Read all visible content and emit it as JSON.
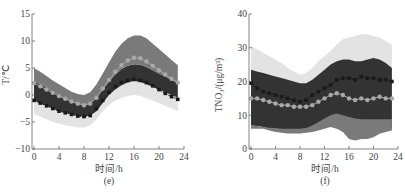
{
  "chart_data": [
    {
      "type": "area",
      "panel_label": "(e)",
      "xlabel": "时间/h",
      "ylabel": "T/℃",
      "xlim": [
        0,
        24
      ],
      "ylim": [
        -10,
        15
      ],
      "xticks": [
        0,
        4,
        8,
        12,
        16,
        20,
        24
      ],
      "yticks": [
        -10,
        -5,
        0,
        5,
        10,
        15
      ],
      "x": [
        0,
        1,
        2,
        3,
        4,
        5,
        6,
        7,
        8,
        9,
        10,
        11,
        12,
        13,
        14,
        15,
        16,
        17,
        18,
        19,
        20,
        21,
        22,
        23
      ],
      "bands": [
        {
          "name": "light-range",
          "color": "#e3e3e3",
          "upper": [
            -1,
            -1.5,
            -2,
            -2.5,
            -3,
            -3.5,
            -3.8,
            -4,
            -4.2,
            -4,
            -3,
            -1.5,
            0,
            1,
            1.8,
            2.3,
            2.6,
            2.4,
            2,
            1.5,
            1,
            0.5,
            0,
            -0.5
          ],
          "lower": [
            -3.5,
            -4,
            -4.5,
            -5,
            -5.3,
            -5.6,
            -5.8,
            -6,
            -6,
            -5.6,
            -4.5,
            -3,
            -1.8,
            -1,
            -0.5,
            -0.2,
            0,
            -0.2,
            -0.6,
            -1,
            -1.5,
            -2,
            -2.5,
            -3
          ]
        },
        {
          "name": "dark-range",
          "color": "#333333",
          "upper": [
            2.5,
            2,
            1.3,
            0.6,
            0,
            -0.6,
            -1.2,
            -1.6,
            -1.8,
            -1.5,
            -0.5,
            1,
            2.5,
            3.8,
            4.8,
            5.4,
            5.7,
            5.6,
            5.2,
            4.6,
            4,
            3.4,
            2.8,
            2.2
          ],
          "lower": [
            -1,
            -1.5,
            -2,
            -2.5,
            -3,
            -3.3,
            -3.6,
            -3.9,
            -4,
            -3.8,
            -3,
            -1.5,
            0,
            1,
            1.8,
            2.3,
            2.6,
            2.4,
            2,
            1.5,
            1,
            0.5,
            0,
            -0.5
          ]
        },
        {
          "name": "mid-range",
          "color": "#7a7a7a",
          "upper": [
            5,
            4.3,
            3.5,
            2.7,
            2,
            1.3,
            0.6,
            0.2,
            0,
            0.5,
            2,
            4,
            6,
            8,
            9.5,
            10.5,
            11,
            11,
            10.5,
            9.5,
            8.5,
            7.5,
            6.5,
            5.5
          ],
          "lower": [
            2.5,
            2,
            1.3,
            0.6,
            0,
            -0.6,
            -1.2,
            -1.6,
            -1.8,
            -1.5,
            -0.5,
            1,
            2.5,
            3.8,
            4.8,
            5.4,
            5.7,
            5.6,
            5.2,
            4.6,
            4,
            3.4,
            2.8,
            2.2
          ]
        }
      ],
      "series": [
        {
          "name": "gray-markers",
          "color": "#a8a8a8",
          "marker": "circle",
          "values": [
            2.2,
            1.6,
            1,
            0.4,
            -0.2,
            -0.7,
            -1.2,
            -1.6,
            -1.9,
            -1.6,
            -0.5,
            1.2,
            2.8,
            4.3,
            5.5,
            6.4,
            6.9,
            6.8,
            6.2,
            5.4,
            4.6,
            3.8,
            3,
            2.3
          ]
        },
        {
          "name": "black-markers",
          "color": "#1a1a1a",
          "marker": "square",
          "values": [
            -1,
            -1.5,
            -2,
            -2.5,
            -3,
            -3.3,
            -3.6,
            -3.9,
            -4,
            -3.8,
            -2.5,
            -1,
            0.5,
            1.6,
            2.3,
            2.7,
            2.9,
            2.7,
            2.3,
            1.7,
            1,
            0.3,
            -0.3,
            -0.8
          ]
        }
      ]
    },
    {
      "type": "area",
      "panel_label": "(f)",
      "xlabel": "时间/h",
      "ylabel": "TNO₃/(μg/m³)",
      "xlim": [
        0,
        24
      ],
      "ylim": [
        0,
        40
      ],
      "xticks": [
        0,
        4,
        8,
        12,
        16,
        20,
        24
      ],
      "yticks": [
        0,
        10,
        20,
        30,
        40
      ],
      "x": [
        0,
        1,
        2,
        3,
        4,
        5,
        6,
        7,
        8,
        9,
        10,
        11,
        12,
        13,
        14,
        15,
        16,
        17,
        18,
        19,
        20,
        21,
        22,
        23
      ],
      "bands": [
        {
          "name": "light-range",
          "color": "#e3e3e3",
          "upper": [
            30.5,
            29.5,
            28.5,
            27.5,
            26.5,
            25.5,
            24,
            23,
            22,
            22.5,
            24,
            26,
            27.5,
            29,
            31,
            32.5,
            33,
            33.5,
            34,
            34,
            33.5,
            33,
            32,
            31
          ],
          "lower": [
            23.5,
            23,
            22.5,
            22,
            21.5,
            21,
            20.5,
            20,
            19.5,
            19.5,
            20.5,
            22,
            23.5,
            25,
            26,
            26.5,
            26.5,
            26,
            26,
            26.5,
            27,
            26.5,
            25.5,
            24
          ]
        },
        {
          "name": "dark-range",
          "color": "#333333",
          "upper": [
            23.5,
            23,
            22.5,
            22,
            21.5,
            21,
            20.5,
            20,
            19.5,
            19.5,
            20.5,
            22,
            23.5,
            25,
            26,
            26.5,
            26.5,
            26,
            26,
            26.5,
            27,
            26.5,
            25.5,
            24
          ],
          "lower": [
            7,
            6.8,
            6.5,
            6,
            5.5,
            5.2,
            5,
            5,
            5,
            5.2,
            5.5,
            6,
            6.5,
            7.5,
            8,
            7.5,
            6.5,
            5.5,
            5,
            5,
            5.5,
            5.8,
            6,
            6
          ]
        },
        {
          "name": "mid-range",
          "color": "#7a7a7a",
          "upper": [
            7,
            6.8,
            6.5,
            6.3,
            6.2,
            6,
            6,
            6,
            6,
            6.2,
            7,
            8,
            9,
            10,
            10.5,
            10,
            9.5,
            9,
            8.8,
            8.8,
            8.8,
            8.8,
            8.8,
            8.8
          ],
          "lower": [
            6,
            6,
            6,
            5.5,
            5,
            4.8,
            4.6,
            4.6,
            4.6,
            4.8,
            5,
            5.5,
            6,
            6.5,
            6,
            5,
            3,
            2.5,
            3,
            3,
            3.5,
            4.5,
            5,
            5.5
          ]
        }
      ],
      "series": [
        {
          "name": "gray-markers",
          "color": "#a8a8a8",
          "marker": "circle",
          "values": [
            15,
            15,
            14.5,
            14,
            13.5,
            13,
            13,
            12.5,
            12.5,
            12.5,
            13,
            14,
            15,
            16,
            16.5,
            16,
            15,
            14.5,
            15,
            14.5,
            15,
            15.5,
            15,
            15
          ]
        },
        {
          "name": "black-markers",
          "color": "#1a1a1a",
          "marker": "square",
          "values": [
            19.5,
            18,
            17,
            16.5,
            16,
            15.5,
            15,
            14.5,
            14,
            14.5,
            16,
            17,
            18,
            19,
            20.5,
            21,
            21,
            20.5,
            21.5,
            21,
            21,
            20.5,
            20.5,
            20
          ]
        }
      ]
    }
  ]
}
